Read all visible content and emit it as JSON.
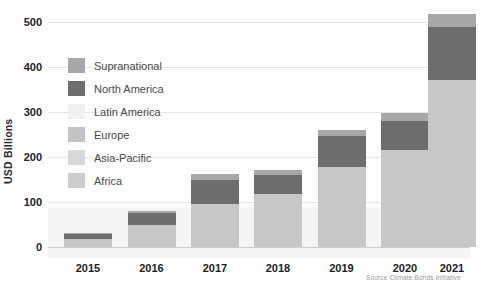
{
  "chart_data": {
    "type": "bar",
    "subtype": "stacked-bar",
    "title": "",
    "subtitle": "",
    "xlabel": "",
    "ylabel": "USD Billions",
    "categories": [
      "2015",
      "2016",
      "2017",
      "2018",
      "2019",
      "2020",
      "2021"
    ],
    "ylim": [
      0,
      500
    ],
    "yticks": [
      0,
      100,
      200,
      300,
      400,
      500
    ],
    "ytick_labels": [
      "0",
      "100",
      "200",
      "300",
      "400",
      "500"
    ],
    "grid": true,
    "legend_position": "upper-left-inside",
    "series": [
      {
        "name": "Europe",
        "color": "#c7c7c7",
        "values": [
          18,
          50,
          95,
          118,
          178,
          215,
          372
        ]
      },
      {
        "name": "North America",
        "color": "#6d6d6d",
        "values": [
          10,
          25,
          55,
          42,
          68,
          65,
          118
        ]
      },
      {
        "name": "Supranational",
        "color": "#a8a8a8",
        "values": [
          4,
          6,
          12,
          11,
          13,
          17,
          27
        ]
      }
    ],
    "totals": [
      32,
      81,
      162,
      171,
      259,
      297,
      517
    ],
    "source": "Source Climate Bonds Initiative"
  },
  "axes": {
    "y_title": "USD Billions",
    "y_ticks": [
      {
        "value": 500,
        "label": "500"
      },
      {
        "value": 400,
        "label": "400"
      },
      {
        "value": 300,
        "label": "300"
      },
      {
        "value": 200,
        "label": "200"
      },
      {
        "value": 100,
        "label": "100"
      },
      {
        "value": 0,
        "label": "0"
      }
    ],
    "x_ticks": [
      {
        "label": "2015"
      },
      {
        "label": "2016"
      },
      {
        "label": "2017"
      },
      {
        "label": "2018"
      },
      {
        "label": "2019"
      },
      {
        "label": "2020"
      },
      {
        "label": "2021"
      }
    ]
  },
  "legend": {
    "items": [
      {
        "label": "Supranational",
        "color": "#a8a8a8"
      },
      {
        "label": "North America",
        "color": "#6d6d6d"
      },
      {
        "label": "Latin America",
        "color": "#f0f0f0"
      },
      {
        "label": "Europe",
        "color": "#c4c4c4"
      },
      {
        "label": "Asia-Pacific",
        "color": "#d8d8d8"
      },
      {
        "label": "Africa",
        "color": "#cdcdcd"
      }
    ]
  },
  "footer": {
    "source": "Source Climate Bonds Initiative"
  },
  "colors": {
    "background": "#fefefe",
    "gridline": "#e6e6e6",
    "axis": "#cfcfcf",
    "tick_text": "#222222",
    "legend_text": "#4a4a4a",
    "source_text": "#9b9b9b"
  }
}
